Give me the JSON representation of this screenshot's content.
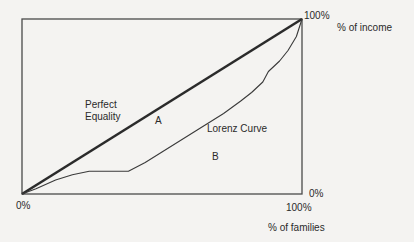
{
  "chart_data": {
    "type": "line",
    "title": "",
    "xlabel": "% of families",
    "ylabel": "% of income",
    "xlim": [
      0,
      100
    ],
    "ylim": [
      0,
      100
    ],
    "grid": false,
    "tick_labels": {
      "origin": "0%",
      "x_max": "100%",
      "y_max": "100%",
      "y_min_right": "0%"
    },
    "series": [
      {
        "name": "Perfect Equality",
        "style": "thick",
        "x": [
          0,
          100
        ],
        "y": [
          0,
          100
        ]
      },
      {
        "name": "Lorenz Curve",
        "style": "thin",
        "x": [
          0,
          5,
          12,
          18,
          24,
          30,
          38,
          44,
          50,
          56,
          62,
          68,
          72,
          78,
          82,
          86,
          88,
          92,
          95,
          98,
          100
        ],
        "y": [
          0,
          3,
          8,
          11,
          13,
          13,
          13,
          18,
          24,
          30,
          36,
          42,
          46,
          53,
          58,
          64,
          70,
          76,
          82,
          90,
          100
        ]
      }
    ],
    "annotations": [
      {
        "text": "Perfect\nEquality",
        "target": "equality line"
      },
      {
        "text": "A",
        "target": "area between equality line and Lorenz curve"
      },
      {
        "text": "Lorenz Curve",
        "target": "Lorenz curve"
      },
      {
        "text": "B",
        "target": "area under Lorenz curve"
      }
    ]
  },
  "labels": {
    "perfect_line1": "Perfect",
    "perfect_line2": "Equality",
    "area_a": "A",
    "lorenz": "Lorenz Curve",
    "area_b": "B",
    "origin": "0%",
    "y_max": "100%",
    "y_axis_title": "% of income",
    "right_zero": "0%",
    "x_max": "100%",
    "x_axis_title": "% of families"
  },
  "colors": {
    "background": "#f4f3f1",
    "frame": "#4a4a4a",
    "equality_line": "#2b2b2b",
    "lorenz_line": "#3a3a3a",
    "text": "#2a2a2a"
  }
}
